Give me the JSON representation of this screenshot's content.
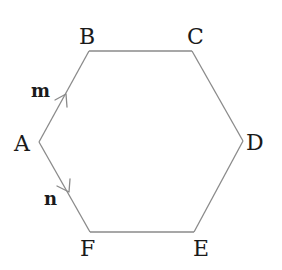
{
  "diagram": {
    "shape": "regular-hexagon",
    "vertices": [
      "A",
      "B",
      "C",
      "D",
      "E",
      "F"
    ],
    "edges": [
      {
        "from": "A",
        "to": "B",
        "vector": "m"
      },
      {
        "from": "B",
        "to": "C"
      },
      {
        "from": "C",
        "to": "D"
      },
      {
        "from": "D",
        "to": "E"
      },
      {
        "from": "E",
        "to": "F"
      },
      {
        "from": "F",
        "to": "A",
        "vector": "n",
        "direction": "A-to-F"
      }
    ],
    "labels": {
      "A": "A",
      "B": "B",
      "C": "C",
      "D": "D",
      "E": "E",
      "F": "F"
    },
    "vectors": {
      "m": "m",
      "n": "n"
    },
    "colors": {
      "edge": "#8a8a8a",
      "text": "#1a1a1a"
    }
  }
}
